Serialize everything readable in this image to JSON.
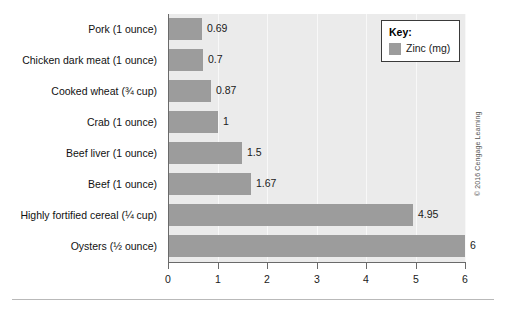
{
  "chart_data": {
    "type": "bar",
    "orientation": "horizontal",
    "title": "",
    "xlabel": "",
    "ylabel": "",
    "xlim": [
      0,
      6
    ],
    "xticks": [
      "0",
      "1",
      "2",
      "3",
      "4",
      "5",
      "6"
    ],
    "grid": true,
    "legend_position": "top-right",
    "categories": [
      "Pork (1 ounce)",
      "Chicken dark meat (1 ounce)",
      "Cooked wheat (¾ cup)",
      "Crab (1 ounce)",
      "Beef liver (1 ounce)",
      "Beef (1 ounce)",
      "Highly fortified cereal (¼ cup)",
      "Oysters (½ ounce)"
    ],
    "series": [
      {
        "name": "Zinc (mg)",
        "color": "#9c9c9c",
        "values": [
          0.69,
          0.7,
          0.87,
          1,
          1.5,
          1.67,
          4.95,
          6
        ],
        "labels": [
          "0.69",
          "0.7",
          "0.87",
          "1",
          "1.5",
          "1.67",
          "4.95",
          "6"
        ]
      }
    ]
  },
  "legend": {
    "title": "Key:",
    "entries": [
      {
        "label": "Zinc (mg)",
        "color": "#9c9c9c"
      }
    ]
  },
  "credit": "© 2016 Cengage Learning",
  "colors": {
    "bar": "#9c9c9c",
    "plot_background": "#ebebeb",
    "axis": "#6a6a6a",
    "gridline": "#f8f8f8",
    "text": "#1a1a1a",
    "legend_border": "#3a3a3a",
    "rule": "#b9b9b9"
  }
}
